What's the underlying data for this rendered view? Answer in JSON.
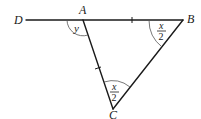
{
  "diagram": {
    "type": "triangle-with-extended-side",
    "points": {
      "D": {
        "label": "D"
      },
      "A": {
        "label": "A"
      },
      "B": {
        "label": "B"
      },
      "C": {
        "label": "C"
      }
    },
    "segments": [
      {
        "from": "D",
        "to": "B",
        "note": "straight line through A"
      },
      {
        "from": "A",
        "to": "C"
      },
      {
        "from": "B",
        "to": "C"
      }
    ],
    "equal_marks": [
      {
        "segment": "AB",
        "ticks": 1
      },
      {
        "segment": "AC",
        "ticks": 1
      }
    ],
    "angles": [
      {
        "vertex": "A",
        "between": "DA-AC",
        "label": "y"
      },
      {
        "vertex": "B",
        "between": "AB-BC",
        "label_num": "x",
        "label_den": "2"
      },
      {
        "vertex": "C",
        "between": "CA-CB",
        "label_num": "x",
        "label_den": "2"
      }
    ]
  }
}
